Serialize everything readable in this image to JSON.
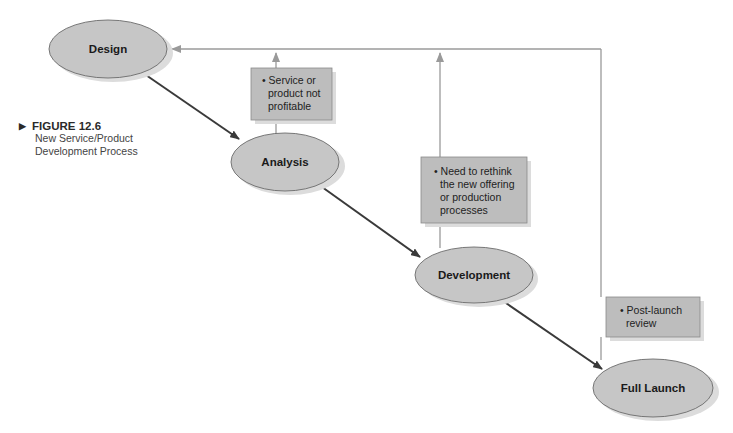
{
  "figure": {
    "number": "FIGURE 12.6",
    "caption_line1": "New Service/Product",
    "caption_line2": "Development Process",
    "marker_icon": "triangle-right-icon"
  },
  "nodes": [
    {
      "id": "design",
      "label": "Design"
    },
    {
      "id": "analysis",
      "label": "Analysis"
    },
    {
      "id": "development",
      "label": "Development"
    },
    {
      "id": "full_launch",
      "label": "Full Launch"
    }
  ],
  "feedback_boxes": [
    {
      "id": "box1",
      "lines": [
        "• Service or",
        "product not",
        "profitable"
      ]
    },
    {
      "id": "box2",
      "lines": [
        "• Need to rethink",
        "the new offering",
        "or production",
        "processes"
      ]
    },
    {
      "id": "box3",
      "lines": [
        "• Post-launch",
        "review"
      ]
    }
  ],
  "edges": [
    {
      "from": "design",
      "to": "analysis",
      "type": "forward"
    },
    {
      "from": "analysis",
      "to": "development",
      "type": "forward"
    },
    {
      "from": "development",
      "to": "full_launch",
      "type": "forward"
    },
    {
      "from": "analysis",
      "to": "design",
      "type": "feedback",
      "via": "box1"
    },
    {
      "from": "development",
      "to": "design",
      "type": "feedback",
      "via": "box2"
    },
    {
      "from": "full_launch",
      "to": "design",
      "type": "feedback",
      "via": "box3"
    }
  ],
  "colors": {
    "ellipse_fill": "#c6c6c6",
    "ellipse_stroke": "#6b6b6b",
    "shadow": "#dcdcdc",
    "box_fill": "#bdbdbd",
    "forward_arrow": "#3a3a3a",
    "feedback_line": "#9a9a9a"
  }
}
